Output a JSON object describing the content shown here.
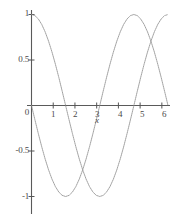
{
  "chart_data": {
    "type": "line",
    "title": "",
    "subtitle": "",
    "xlabel": "x",
    "ylabel": "",
    "xlim": [
      0,
      6.283185
    ],
    "ylim": [
      -1,
      1
    ],
    "grid": false,
    "legend": "none",
    "xticks": [
      0,
      1,
      2,
      3,
      4,
      5,
      6
    ],
    "xtick_labels": [
      "0",
      "1",
      "2",
      "3",
      "4",
      "5",
      "6"
    ],
    "yticks": [
      -1,
      -0.5,
      0.5,
      1
    ],
    "ytick_labels": [
      "-1",
      "-0.5",
      "0.5",
      "1"
    ],
    "axis_color": "#555555",
    "series": [
      {
        "name": "cos(x)",
        "color": "#8a8a8a",
        "style": "dotted-thin",
        "x": [
          0,
          0.1571,
          0.3142,
          0.4712,
          0.6283,
          0.7854,
          0.9425,
          1.0996,
          1.2566,
          1.4137,
          1.5708,
          1.7279,
          1.885,
          2.042,
          2.1991,
          2.3562,
          2.5133,
          2.6704,
          2.8274,
          2.9845,
          3.1416,
          3.2987,
          3.4558,
          3.6128,
          3.7699,
          3.927,
          4.0841,
          4.2412,
          4.3982,
          4.5553,
          4.7124,
          4.8695,
          5.0265,
          5.1836,
          5.3407,
          5.4978,
          5.6549,
          5.8119,
          5.969,
          6.1261,
          6.2832
        ],
        "y": [
          1.0,
          0.9877,
          0.9511,
          0.891,
          0.809,
          0.7071,
          0.5878,
          0.454,
          0.309,
          0.1564,
          0.0,
          -0.1564,
          -0.309,
          -0.454,
          -0.5878,
          -0.7071,
          -0.809,
          -0.891,
          -0.9511,
          -0.9877,
          -1.0,
          -0.9877,
          -0.9511,
          -0.891,
          -0.809,
          -0.7071,
          -0.5878,
          -0.454,
          -0.309,
          -0.1564,
          0.0,
          0.1564,
          0.309,
          0.454,
          0.5878,
          0.7071,
          0.809,
          0.891,
          0.9511,
          0.9877,
          1.0
        ]
      },
      {
        "name": "-sin(x)",
        "color": "#8a8a8a",
        "style": "dotted-thin",
        "x": [
          0,
          0.1571,
          0.3142,
          0.4712,
          0.6283,
          0.7854,
          0.9425,
          1.0996,
          1.2566,
          1.4137,
          1.5708,
          1.7279,
          1.885,
          2.042,
          2.1991,
          2.3562,
          2.5133,
          2.6704,
          2.8274,
          2.9845,
          3.1416,
          3.2987,
          3.4558,
          3.6128,
          3.7699,
          3.927,
          4.0841,
          4.2412,
          4.3982,
          4.5553,
          4.7124,
          4.8695,
          5.0265,
          5.1836,
          5.3407,
          5.4978,
          5.6549,
          5.8119,
          5.969,
          6.1261,
          6.2832
        ],
        "y": [
          0.0,
          -0.1564,
          -0.309,
          -0.454,
          -0.5878,
          -0.7071,
          -0.809,
          -0.891,
          -0.9511,
          -0.9877,
          -1.0,
          -0.9877,
          -0.9511,
          -0.891,
          -0.809,
          -0.7071,
          -0.5878,
          -0.454,
          -0.309,
          -0.1564,
          0.0,
          0.1564,
          0.309,
          0.454,
          0.5878,
          0.7071,
          0.809,
          0.891,
          0.9511,
          0.9877,
          1.0,
          0.9877,
          0.9511,
          0.891,
          0.809,
          0.7071,
          0.5878,
          0.454,
          0.309,
          0.1564,
          0.0
        ]
      }
    ]
  },
  "labels": {
    "y_1": "1",
    "y_05": "0.5",
    "y_0": "0",
    "y_neg05": "-0.5",
    "y_neg1": "-1",
    "x_1": "1",
    "x_2": "2",
    "x_3": "3",
    "x_4": "4",
    "x_5": "5",
    "x_6": "6",
    "x_axis_name": "x"
  }
}
